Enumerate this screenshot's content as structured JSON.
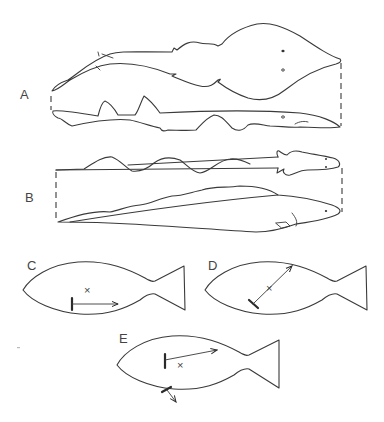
{
  "figure": {
    "panels": [
      {
        "id": "A",
        "label": "A",
        "description": "Ray-like fish (top view) and shark (side view) outlines linked by dashed lines"
      },
      {
        "id": "B",
        "label": "B",
        "description": "Elongated salamander-like animal (top view) and eel-like fish (side view) linked by dashed lines"
      },
      {
        "id": "C",
        "label": "C",
        "description": "Fish outline with center mark and horizontal arrow from bar"
      },
      {
        "id": "D",
        "label": "D",
        "description": "Fish outline with center mark and diagonal arrow from tilted bar"
      },
      {
        "id": "E",
        "label": "E",
        "description": "Fish outline with center mark, arrow from vertical bar and small arrow at belly"
      }
    ],
    "center_mark": "×"
  }
}
